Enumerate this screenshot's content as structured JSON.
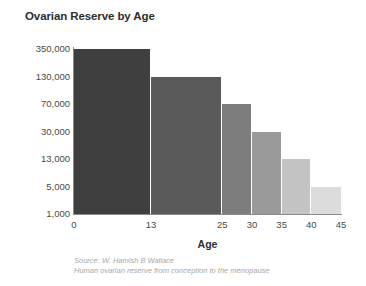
{
  "chart_data": {
    "type": "bar",
    "title": "Ovarian Reserve by Age",
    "xlabel": "Age",
    "ylabel": "",
    "categories": [
      "0-13",
      "13-25",
      "25-30",
      "30-35",
      "35-40",
      "40-45"
    ],
    "values": [
      350000,
      130000,
      70000,
      30000,
      13000,
      5000
    ],
    "bar_start_ages": [
      0,
      13,
      25,
      30,
      35,
      40
    ],
    "bar_end_ages": [
      13,
      25,
      30,
      35,
      40,
      45
    ],
    "bar_colors": [
      "#3f3f3f",
      "#5a5a5a",
      "#7d7d7d",
      "#9a9a9a",
      "#c4c4c4",
      "#dcdcdc"
    ],
    "x_ticks": [
      0,
      13,
      25,
      30,
      35,
      40,
      45
    ],
    "x_tick_labels": [
      "0",
      "13",
      "25",
      "30",
      "35",
      "40",
      "45"
    ],
    "xlim": [
      0,
      45
    ],
    "y_ticks": [
      350000,
      130000,
      70000,
      30000,
      13000,
      5000,
      1000
    ],
    "y_tick_labels": [
      "350,000",
      "130,000",
      "70,000",
      "30,000",
      "13,000",
      "5,000",
      "1,000"
    ],
    "y_scale": "nonlinear-even-ticks",
    "grid": false,
    "legend": null
  },
  "source": {
    "line1": "Source: W. Hamish B Wallace",
    "line2": "Human ovarian reserve from conception to the menopause"
  }
}
